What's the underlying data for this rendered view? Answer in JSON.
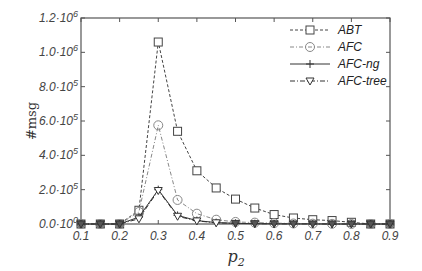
{
  "chart_data": {
    "type": "line",
    "title": "",
    "xlabel": "p2",
    "ylabel": "#msg",
    "xlim": [
      0.1,
      0.9
    ],
    "ylim": [
      0,
      1200000
    ],
    "grid": false,
    "legend_position": "top-right",
    "x": [
      0.1,
      0.15,
      0.2,
      0.25,
      0.3,
      0.35,
      0.4,
      0.45,
      0.5,
      0.55,
      0.6,
      0.65,
      0.7,
      0.75,
      0.8,
      0.85,
      0.9
    ],
    "x_tick_labels": [
      "0.1",
      "0.2",
      "0.3",
      "0.4",
      "0.5",
      "0.6",
      "0.7",
      "0.8",
      "0.9"
    ],
    "y_ticks": [
      0,
      200000,
      400000,
      600000,
      800000,
      1000000,
      1200000
    ],
    "y_tick_labels": [
      {
        "mant": "0.0·10",
        "exp": "0"
      },
      {
        "mant": "2.0·10",
        "exp": "5"
      },
      {
        "mant": "4.0·10",
        "exp": "5"
      },
      {
        "mant": "6.0·10",
        "exp": "5"
      },
      {
        "mant": "8.0·10",
        "exp": "5"
      },
      {
        "mant": "1.0·10",
        "exp": "6"
      },
      {
        "mant": "1.2·10",
        "exp": "6"
      }
    ],
    "series": [
      {
        "name": "ABT",
        "marker": "square",
        "dash": "3,2",
        "color": "#444444",
        "values": [
          0,
          0,
          0,
          80000,
          1060000,
          540000,
          310000,
          210000,
          145000,
          93000,
          55000,
          35000,
          25000,
          20000,
          10000,
          0,
          0
        ]
      },
      {
        "name": "AFC",
        "marker": "circle",
        "dash": "4,2,1,2",
        "color": "#888888",
        "values": [
          0,
          0,
          0,
          70000,
          575000,
          140000,
          60000,
          25000,
          12000,
          8000,
          5000,
          3000,
          2000,
          1000,
          0,
          0,
          0
        ]
      },
      {
        "name": "AFC-ng",
        "marker": "plus",
        "dash": "",
        "color": "#333333",
        "values": [
          0,
          0,
          0,
          40000,
          200000,
          50000,
          20000,
          8000,
          4000,
          2000,
          1000,
          500,
          300,
          200,
          0,
          0,
          0
        ]
      },
      {
        "name": "AFC-tree",
        "marker": "triangle-down",
        "dash": "5,2,1,2",
        "color": "#333333",
        "values": [
          0,
          0,
          0,
          30000,
          195000,
          45000,
          18000,
          7000,
          3500,
          2000,
          1000,
          500,
          300,
          200,
          0,
          0,
          0
        ]
      }
    ]
  },
  "labels": {
    "ylabel": "#msg",
    "xlabel_base": "p",
    "xlabel_sub": "2"
  }
}
